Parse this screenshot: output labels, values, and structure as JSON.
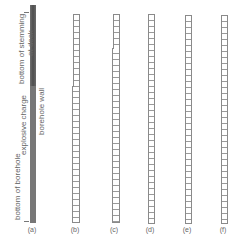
{
  "figure": {
    "panel_a": {
      "label": "(a)",
      "annotations": {
        "bottom_of_stemming": "bottom of stemming",
        "at_deck": "at deck",
        "explosive_charge": "explosive charge",
        "borehole_wall": "borehole wall",
        "bottom_of_borehole": "bottom of borehole"
      }
    },
    "panels": [
      {
        "label": "(b)"
      },
      {
        "label": "(c)"
      },
      {
        "label": "(d)"
      },
      {
        "label": "(e)"
      },
      {
        "label": "(f)"
      }
    ],
    "colors": {
      "charge_fill": "#5a5a5a",
      "ladder_line": "#8a8a8a",
      "text": "#666666",
      "background": "#ffffff"
    }
  }
}
